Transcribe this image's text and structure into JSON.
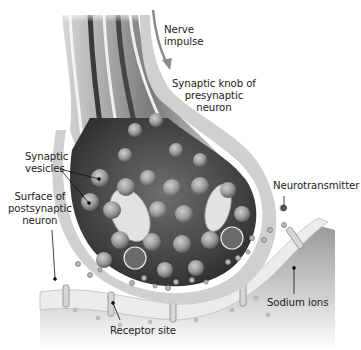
{
  "diagram": {
    "type": "anatomical-illustration",
    "colors": {
      "background": "#ffffff",
      "membrane": "#e6e6e6",
      "cytoplasm": "#4a4a4a",
      "vesicle": "#8c8c8c",
      "label_text": "#222222",
      "leader_line": "#111111",
      "arrow": "#8a8a8a"
    },
    "labels": {
      "nerve_impulse": [
        "Nerve",
        "impulse"
      ],
      "synaptic_knob": [
        "Synaptic knob of",
        "presynaptic",
        "neuron"
      ],
      "synaptic_vesicles": [
        "Synaptic",
        "vesicles"
      ],
      "neurotransmitter": "Neurotransmitter",
      "postsynaptic_surface": [
        "Surface of",
        "postsynaptic",
        "neuron"
      ],
      "sodium_ions": "Sodium ions",
      "receptor_site": "Receptor site"
    }
  }
}
